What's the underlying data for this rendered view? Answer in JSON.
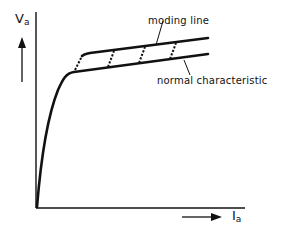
{
  "diagram": {
    "type": "characteristic-curve",
    "y_axis": {
      "symbol": "V",
      "subscript": "a"
    },
    "x_axis": {
      "symbol": "I",
      "subscript": "a"
    },
    "annotations": {
      "moding_line": "moding line",
      "normal_characteristic": "normal characteristic"
    },
    "colors": {
      "ink": "#111111",
      "background": "#ffffff"
    }
  }
}
